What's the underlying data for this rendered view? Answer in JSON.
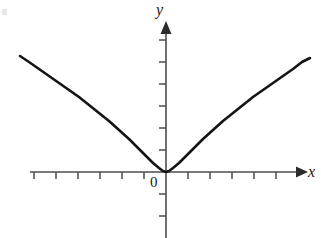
{
  "figure": {
    "background_color": "#ffffff",
    "ink_color": "#1a1a1a",
    "axis_color": "#4d4d4d",
    "curve_color": "#141414",
    "width": 321,
    "height": 238
  },
  "labels": {
    "y_axis": "y",
    "x_axis": "x",
    "origin": "0"
  },
  "chart_data": {
    "type": "line",
    "title": "",
    "subtitle": "",
    "xlabel": "x",
    "ylabel": "y",
    "legend": [],
    "legend_position": "none",
    "grid": false,
    "axes": {
      "x_axis": {
        "label": "x",
        "pixel_y": 172,
        "pixel_x_start": 30,
        "pixel_x_end": 303,
        "arrow": "right",
        "tick_spacing_px": 22,
        "tick_length_px": 6,
        "tick_direction": "down",
        "tick_pixel_x": [
          34,
          56,
          78,
          100,
          122,
          144,
          166,
          188,
          210,
          232,
          254,
          276
        ],
        "tick_labels": [],
        "origin_pixel_x": 166
      },
      "y_axis": {
        "label": "y",
        "pixel_x": 166,
        "pixel_y_start": 238,
        "pixel_y_end": 22,
        "arrow": "up",
        "tick_spacing_px": 22,
        "tick_length_px": 6,
        "tick_direction": "left",
        "tick_pixel_y": [
          40,
          62,
          84,
          106,
          128,
          150,
          194,
          216
        ],
        "tick_labels": [],
        "origin_pixel_y": 172
      }
    },
    "x": [
      -6.64,
      -6.0,
      -5.4,
      -4.8,
      -4.2,
      -3.6,
      -3.0,
      -2.4,
      -1.8,
      -1.2,
      -0.6,
      0.0,
      0.6,
      1.2,
      1.8,
      2.4,
      3.0,
      3.6,
      4.2,
      4.8,
      5.4,
      6.0,
      6.55
    ],
    "y": [
      5.27,
      4.95,
      4.6,
      4.23,
      3.83,
      3.4,
      2.93,
      2.42,
      1.86,
      1.27,
      0.64,
      0.0,
      0.64,
      1.27,
      1.86,
      2.42,
      2.93,
      3.4,
      3.83,
      4.23,
      4.6,
      4.95,
      5.18
    ],
    "xlim": [
      -6.64,
      6.55
    ],
    "ylim": [
      0.0,
      5.3
    ],
    "series": [
      {
        "name": "curve",
        "points_px": [
          [
            20,
            56
          ],
          [
            29,
            62
          ],
          [
            39,
            69
          ],
          [
            49,
            76
          ],
          [
            59,
            83
          ],
          [
            69,
            90
          ],
          [
            79,
            97
          ],
          [
            89,
            105
          ],
          [
            99,
            113
          ],
          [
            109,
            121
          ],
          [
            119,
            130
          ],
          [
            129,
            139
          ],
          [
            138,
            148
          ],
          [
            146,
            156
          ],
          [
            153,
            163
          ],
          [
            159,
            168
          ],
          [
            163,
            171
          ],
          [
            166,
            172
          ],
          [
            169,
            171
          ],
          [
            173,
            168
          ],
          [
            179,
            163
          ],
          [
            186,
            156
          ],
          [
            194,
            148
          ],
          [
            203,
            139
          ],
          [
            213,
            130
          ],
          [
            223,
            121
          ],
          [
            233,
            113
          ],
          [
            243,
            105
          ],
          [
            253,
            97
          ],
          [
            263,
            90
          ],
          [
            273,
            83
          ],
          [
            283,
            76
          ],
          [
            293,
            69
          ],
          [
            302,
            62
          ],
          [
            310,
            58
          ]
        ],
        "stroke_width": 2.6,
        "color": "#141414"
      }
    ],
    "vertex": {
      "pixel": [
        166,
        172
      ],
      "data": [
        0,
        0
      ],
      "shape": "rounded-minimum-at-origin"
    }
  }
}
